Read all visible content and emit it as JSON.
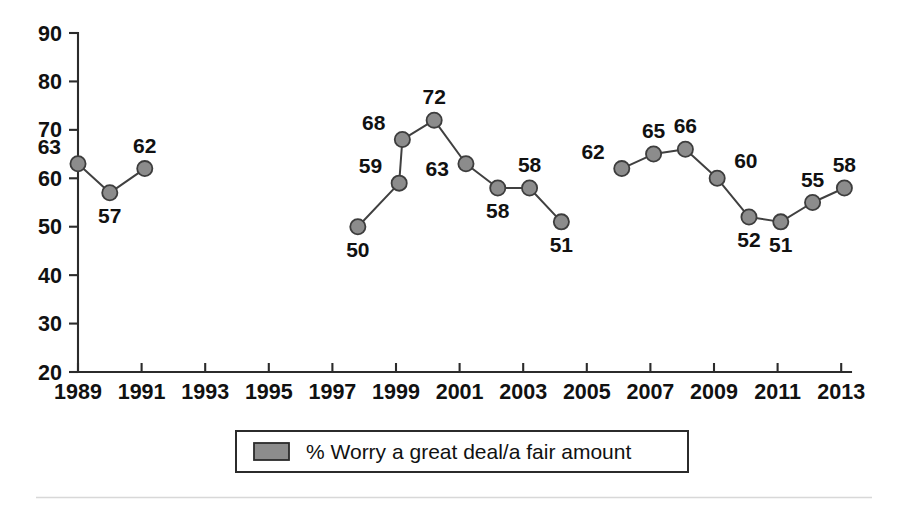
{
  "chart_data": {
    "type": "line",
    "title": "",
    "subtitle": "",
    "xlabel": "",
    "ylabel": "",
    "ylim": [
      20,
      90
    ],
    "xlim": [
      1989,
      2013
    ],
    "ytick_labels": [
      "90",
      "80",
      "70",
      "60",
      "50",
      "40",
      "30",
      "20"
    ],
    "ytick_values": [
      90,
      80,
      70,
      60,
      50,
      40,
      30,
      20
    ],
    "xtick_labels": [
      "1989",
      "1991",
      "1993",
      "1995",
      "1997",
      "1999",
      "2001",
      "2003",
      "2005",
      "2007",
      "2009",
      "2011",
      "2013"
    ],
    "xtick_values": [
      1989,
      1991,
      1993,
      1995,
      1997,
      1999,
      2001,
      2003,
      2005,
      2007,
      2009,
      2011,
      2013
    ],
    "grid": false,
    "legend_position": "bottom-center",
    "series": [
      {
        "name": "% Worry a great deal/a fair amount",
        "color": "#8c8c8c",
        "line_color": "#404040",
        "points": [
          {
            "x": 1989.0,
            "y": 63,
            "label": "63",
            "label_pos": "above-left"
          },
          {
            "x": 1990.0,
            "y": 57,
            "label": "57",
            "label_pos": "below"
          },
          {
            "x": 1991.1,
            "y": 62,
            "label": "62",
            "label_pos": "above"
          },
          {
            "x": 1997.8,
            "y": 50,
            "label": "50",
            "label_pos": "below"
          },
          {
            "x": 1999.1,
            "y": 59,
            "label": "59",
            "label_pos": "above-left"
          },
          {
            "x": 1999.2,
            "y": 68,
            "label": "68",
            "label_pos": "above-left"
          },
          {
            "x": 2000.2,
            "y": 72,
            "label": "72",
            "label_pos": "above"
          },
          {
            "x": 2001.2,
            "y": 63,
            "label": "63",
            "label_pos": "below-left"
          },
          {
            "x": 2002.2,
            "y": 58,
            "label": "58",
            "label_pos": "below"
          },
          {
            "x": 2003.2,
            "y": 58,
            "label": "58",
            "label_pos": "above"
          },
          {
            "x": 2004.2,
            "y": 51,
            "label": "51",
            "label_pos": "below"
          },
          {
            "x": 2006.1,
            "y": 62,
            "label": "62",
            "label_pos": "above-left"
          },
          {
            "x": 2007.1,
            "y": 65,
            "label": "65",
            "label_pos": "above"
          },
          {
            "x": 2008.1,
            "y": 66,
            "label": "66",
            "label_pos": "above"
          },
          {
            "x": 2009.1,
            "y": 60,
            "label": "60",
            "label_pos": "above-right"
          },
          {
            "x": 2010.1,
            "y": 52,
            "label": "52",
            "label_pos": "below"
          },
          {
            "x": 2011.1,
            "y": 51,
            "label": "51",
            "label_pos": "below"
          },
          {
            "x": 2012.1,
            "y": 55,
            "label": "55",
            "label_pos": "above"
          },
          {
            "x": 2013.1,
            "y": 58,
            "label": "58",
            "label_pos": "above"
          }
        ],
        "gaps_after_x": [
          1991.1,
          2004.2
        ]
      }
    ]
  },
  "legend": {
    "entries": [
      {
        "swatch_color": "#8c8c8c",
        "label": "% Worry a great deal/a fair amount"
      }
    ]
  },
  "colors": {
    "marker_fill": "#8c8c8c",
    "marker_stroke": "#3d3d3d",
    "line": "#404040",
    "axis": "#2b2b2b",
    "text": "#111111",
    "background": "#ffffff",
    "footer_rule": "#d8d8d8"
  }
}
